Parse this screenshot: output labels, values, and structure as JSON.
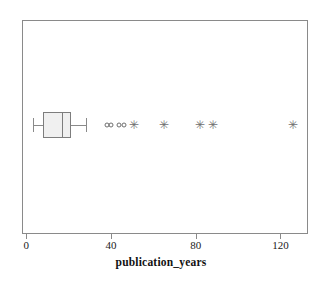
{
  "chart_data": {
    "type": "box",
    "title": "",
    "xlabel": "publication_years",
    "ylabel": "",
    "orientation": "horizontal",
    "xlim": [
      -2,
      133
    ],
    "xticks": [
      0,
      40,
      80,
      120
    ],
    "xtick_labels": [
      "0",
      "40",
      "80",
      "120"
    ],
    "grid": false,
    "legend": null,
    "categories": [
      "publication_years"
    ],
    "box": {
      "whisker_low": 3,
      "q1": 8,
      "median": 17,
      "q3": 21,
      "whisker_high": 28
    },
    "outliers": [
      {
        "value": 38,
        "marker": "circle"
      },
      {
        "value": 40,
        "marker": "circle"
      },
      {
        "value": 44,
        "marker": "circle"
      },
      {
        "value": 46,
        "marker": "circle"
      },
      {
        "value": 51,
        "marker": "star"
      },
      {
        "value": 65,
        "marker": "star"
      },
      {
        "value": 82,
        "marker": "star"
      },
      {
        "value": 88,
        "marker": "star"
      },
      {
        "value": 126,
        "marker": "star"
      }
    ],
    "colors": {
      "box_fill": "#f0f0f0",
      "box_edge": "#7d7d7d",
      "whisker": "#8a8a8a",
      "outlier": "#6f6f6f",
      "frame": "#8a8a8a",
      "background": "#ffffff",
      "text": "#111111"
    },
    "marker_glyphs": {
      "star": "✳"
    }
  }
}
